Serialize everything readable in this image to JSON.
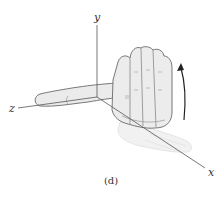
{
  "figure": {
    "caption": "(d)",
    "axes": {
      "x_label": "x",
      "y_label": "y",
      "z_label": "z"
    },
    "illustration": "right-hand-rule",
    "rotation_arrow": "counterclockwise-curl-arrow",
    "colors": {
      "axis": "#555555",
      "hand_fill": "#e9e9e9",
      "hand_shadow": "#f1f1f1",
      "hand_outline": "#6a6a6a",
      "arrow": "#222222"
    }
  }
}
